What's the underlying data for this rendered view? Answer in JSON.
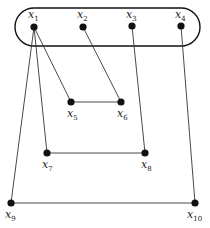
{
  "diagram": {
    "type": "graph",
    "group": {
      "name": "top-set",
      "x": 15,
      "y": 8,
      "width": 185,
      "height": 38,
      "rx": 19,
      "members": [
        "x1",
        "x2",
        "x3",
        "x4"
      ]
    },
    "nodes": [
      {
        "id": "x1",
        "base": "x",
        "sub": "1",
        "cx": 34,
        "cy": 27,
        "lx": 28,
        "ly": 18,
        "label_pos": "above"
      },
      {
        "id": "x2",
        "base": "x",
        "sub": "2",
        "cx": 83,
        "cy": 27,
        "lx": 77,
        "ly": 18,
        "label_pos": "above"
      },
      {
        "id": "x3",
        "base": "x",
        "sub": "3",
        "cx": 132,
        "cy": 26,
        "lx": 126,
        "ly": 18,
        "label_pos": "above"
      },
      {
        "id": "x4",
        "base": "x",
        "sub": "4",
        "cx": 181,
        "cy": 26,
        "lx": 175,
        "ly": 18,
        "label_pos": "above"
      },
      {
        "id": "x5",
        "base": "x",
        "sub": "5",
        "cx": 71,
        "cy": 102,
        "lx": 67,
        "ly": 117,
        "label_pos": "below"
      },
      {
        "id": "x6",
        "base": "x",
        "sub": "6",
        "cx": 121,
        "cy": 102,
        "lx": 117,
        "ly": 117,
        "label_pos": "below"
      },
      {
        "id": "x7",
        "base": "x",
        "sub": "7",
        "cx": 47,
        "cy": 153,
        "lx": 42,
        "ly": 168,
        "label_pos": "below"
      },
      {
        "id": "x8",
        "base": "x",
        "sub": "8",
        "cx": 145,
        "cy": 153,
        "lx": 141,
        "ly": 168,
        "label_pos": "below"
      },
      {
        "id": "x9",
        "base": "x",
        "sub": "9",
        "cx": 11,
        "cy": 203,
        "lx": 5,
        "ly": 218,
        "label_pos": "below"
      },
      {
        "id": "x10",
        "base": "x",
        "sub": "10",
        "cx": 195,
        "cy": 203,
        "lx": 187,
        "ly": 218,
        "label_pos": "below"
      }
    ],
    "edges": [
      {
        "from": "x1",
        "to": "x9"
      },
      {
        "from": "x1",
        "to": "x7"
      },
      {
        "from": "x1",
        "to": "x5"
      },
      {
        "from": "x2",
        "to": "x6"
      },
      {
        "from": "x5",
        "to": "x6"
      },
      {
        "from": "x3",
        "to": "x8"
      },
      {
        "from": "x7",
        "to": "x8"
      },
      {
        "from": "x4",
        "to": "x10"
      },
      {
        "from": "x9",
        "to": "x10"
      }
    ],
    "colors": {
      "node": "#111111",
      "edge": "#333333",
      "group": "#111111",
      "background": "#ffffff"
    }
  }
}
